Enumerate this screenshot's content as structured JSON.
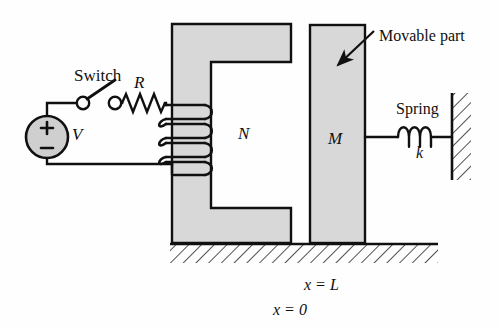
{
  "figure": {
    "background_color": "#fefefe",
    "line_color": "#101010",
    "core_fill_color": "#d8d8d8",
    "source_fill_color": "#cfcfcf"
  },
  "labels": {
    "switch": "Switch",
    "resistance": "R",
    "voltage": "V",
    "turns": "N",
    "mass": "M",
    "movable_part": "Movable part",
    "spring": "Spring",
    "spring_constant": "k",
    "position_L": "x = L",
    "position_0": "x = 0"
  },
  "source": {
    "plus_sign": "+",
    "minus_sign": "−"
  },
  "components": {
    "voltage_source": "dc-voltage-source",
    "switch": "open-switch",
    "resistor": "resistor-zigzag",
    "coil": "inductor-coil-4-turns",
    "core": "c-shaped-magnetic-core",
    "movable_block": "movable-armature-block",
    "spring": "helical-spring-3-coils",
    "wall": "fixed-wall-hatched",
    "ground": "ground-hatched-surface"
  },
  "geometry": {
    "coil_turns": 4,
    "spring_coils": 3
  }
}
